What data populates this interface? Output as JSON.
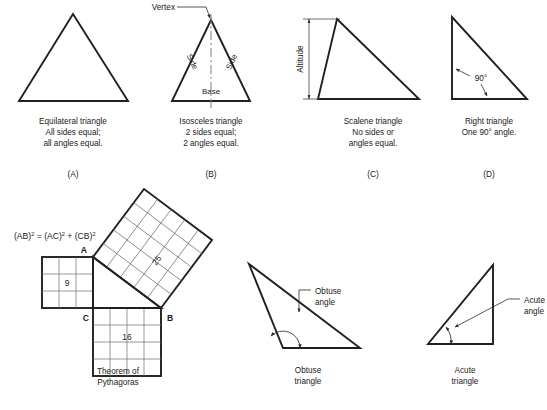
{
  "page": {
    "ink_color": "#231f20",
    "background_color": "#ffffff",
    "grid_color": "#6d6d6d"
  },
  "top_row": {
    "figures": [
      {
        "key": "equilateral",
        "shape": "equilateral-triangle",
        "caption_lines": [
          "Equilateral triangle",
          "All sides equal;",
          "all angles equal."
        ],
        "letter": "(A)",
        "annotations": []
      },
      {
        "key": "isosceles",
        "shape": "isosceles-triangle",
        "caption_lines": [
          "Isosceles triangle",
          "2 sides equal;",
          "2 angles equal."
        ],
        "letter": "(B)",
        "annotations": [
          {
            "name": "vertex-label",
            "text": "Vertex"
          },
          {
            "name": "side-label-left",
            "text": "Side"
          },
          {
            "name": "side-label-right",
            "text": "Side"
          },
          {
            "name": "base-label",
            "text": "Base"
          }
        ]
      },
      {
        "key": "scalene",
        "shape": "scalene-triangle",
        "caption_lines": [
          "Scalene triangle",
          "No sides or",
          "angles equal."
        ],
        "letter": "(C)",
        "annotations": [
          {
            "name": "altitude-label",
            "text": "Altitude"
          }
        ]
      },
      {
        "key": "right",
        "shape": "right-triangle",
        "caption_lines": [
          "Right triangle",
          "One 90° angle."
        ],
        "letter": "(D)",
        "annotations": [
          {
            "name": "right-angle-label",
            "text": "90°"
          }
        ]
      }
    ]
  },
  "pythagoras": {
    "formula": {
      "ab_base": "(AB)",
      "ab_exp": "2",
      "equals": "=",
      "ac_base": "(AC)",
      "ac_exp": "2",
      "plus": "+",
      "cb_base": "(CB)",
      "cb_exp": "2",
      "full_text": "(AB)² = (AC)² + (CB)²"
    },
    "vertices": [
      {
        "name": "vertex-a",
        "label": "A"
      },
      {
        "name": "vertex-b",
        "label": "B"
      },
      {
        "name": "vertex-c",
        "label": "C"
      }
    ],
    "squares": [
      {
        "name": "square-on-ac",
        "area_label": "9",
        "grid": 3,
        "orientation": "axis-aligned"
      },
      {
        "name": "square-on-cb",
        "area_label": "16",
        "grid": 4,
        "orientation": "axis-aligned"
      },
      {
        "name": "square-on-ab",
        "area_label": "25",
        "grid": 5,
        "orientation": "rotated"
      }
    ],
    "caption_lines": [
      "Theorem of",
      "Pythagoras"
    ]
  },
  "bottom_row": {
    "figures": [
      {
        "key": "obtuse",
        "shape": "obtuse-triangle",
        "annotation_lines": [
          "Obtuse",
          "angle"
        ],
        "caption_lines": [
          "Obtuse",
          "triangle"
        ]
      },
      {
        "key": "acute",
        "shape": "acute-triangle",
        "annotation_lines": [
          "Acute",
          "angle"
        ],
        "caption_lines": [
          "Acute",
          "triangle"
        ]
      }
    ]
  }
}
